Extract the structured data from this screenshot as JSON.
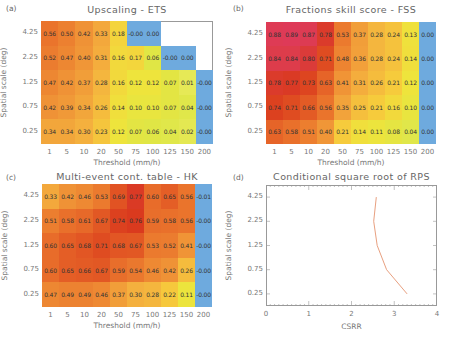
{
  "chart_data": [
    {
      "id": "a",
      "type": "heatmap",
      "panel_label": "(a)",
      "title": "Upscaling - ETS",
      "xlabel": "Threshold (mm/h)",
      "ylabel": "Spatial scale (deg)",
      "x_categories": [
        "1",
        "5",
        "10",
        "20",
        "50",
        "75",
        "100",
        "125",
        "150",
        "200"
      ],
      "y_categories": [
        "4.25",
        "2.25",
        "1.25",
        "0.75",
        "0.25"
      ],
      "values": [
        [
          "0.56",
          "0.50",
          "0.42",
          "0.33",
          "0.18",
          "-0.00",
          "0.00",
          null,
          null,
          null
        ],
        [
          "0.52",
          "0.47",
          "0.40",
          "0.31",
          "0.16",
          "0.17",
          "0.06",
          "-0.00",
          "0.00",
          null
        ],
        [
          "0.47",
          "0.42",
          "0.37",
          "0.28",
          "0.16",
          "0.12",
          "0.12",
          "0.07",
          "0.01",
          "-0.00"
        ],
        [
          "0.42",
          "0.39",
          "0.34",
          "0.26",
          "0.14",
          "0.10",
          "0.10",
          "0.07",
          "0.04",
          "-0.00"
        ],
        [
          "0.34",
          "0.34",
          "0.30",
          "0.23",
          "0.12",
          "0.07",
          "0.06",
          "0.04",
          "0.02",
          "-0.00"
        ]
      ]
    },
    {
      "id": "b",
      "type": "heatmap",
      "panel_label": "(b)",
      "title": "Fractions skill score - FSS",
      "xlabel": "Threshold (mm/h)",
      "ylabel": "Spatial scale (deg)",
      "x_categories": [
        "1",
        "5",
        "10",
        "20",
        "50",
        "75",
        "100",
        "125",
        "150",
        "200"
      ],
      "y_categories": [
        "4.25",
        "2.25",
        "1.25",
        "0.75",
        "0.25"
      ],
      "values": [
        [
          "0.88",
          "0.89",
          "0.87",
          "0.78",
          "0.53",
          "0.37",
          "0.28",
          "0.24",
          "0.13",
          "0.00"
        ],
        [
          "0.84",
          "0.84",
          "0.80",
          "0.71",
          "0.48",
          "0.36",
          "0.28",
          "0.24",
          "0.14",
          "0.00"
        ],
        [
          "0.78",
          "0.77",
          "0.73",
          "0.63",
          "0.41",
          "0.31",
          "0.26",
          "0.21",
          "0.12",
          "0.00"
        ],
        [
          "0.74",
          "0.71",
          "0.66",
          "0.56",
          "0.35",
          "0.25",
          "0.21",
          "0.16",
          "0.10",
          "0.00"
        ],
        [
          "0.63",
          "0.58",
          "0.51",
          "0.40",
          "0.21",
          "0.14",
          "0.11",
          "0.08",
          "0.04",
          "0.00"
        ]
      ]
    },
    {
      "id": "c",
      "type": "heatmap",
      "panel_label": "(c)",
      "title": "Multi-event cont. table - HK",
      "xlabel": "Threshold (mm/h)",
      "ylabel": "Spatial scale (deg)",
      "x_categories": [
        "1",
        "5",
        "10",
        "20",
        "50",
        "75",
        "100",
        "125",
        "150",
        "200"
      ],
      "y_categories": [
        "4.25",
        "2.25",
        "1.25",
        "0.75",
        "0.25"
      ],
      "values": [
        [
          "0.33",
          "0.42",
          "0.46",
          "0.53",
          "0.69",
          "0.77",
          "0.60",
          "0.65",
          "0.56",
          "-0.01"
        ],
        [
          "0.51",
          "0.58",
          "0.61",
          "0.67",
          "0.74",
          "0.76",
          "0.59",
          "0.58",
          "0.56",
          "-0.00"
        ],
        [
          "0.60",
          "0.65",
          "0.68",
          "0.71",
          "0.68",
          "0.67",
          "0.53",
          "0.52",
          "0.41",
          "-0.00"
        ],
        [
          "0.60",
          "0.65",
          "0.66",
          "0.67",
          "0.59",
          "0.54",
          "0.46",
          "0.42",
          "0.26",
          "-0.00"
        ],
        [
          "0.47",
          "0.49",
          "0.49",
          "0.46",
          "0.37",
          "0.30",
          "0.28",
          "0.22",
          "0.11",
          "-0.00"
        ]
      ]
    },
    {
      "id": "d",
      "type": "line",
      "panel_label": "(d)",
      "title": "Conditional square root of RPS",
      "xlabel": "CSRR",
      "ylabel": "Spatial scale (deg)",
      "x_ticks": [
        "0",
        "1",
        "2",
        "3",
        "4"
      ],
      "y_categories": [
        "4.25",
        "2.25",
        "1.25",
        "0.75",
        "0.25"
      ],
      "xlim": [
        0,
        4
      ],
      "series": [
        {
          "name": "CSRR",
          "color": "#e8a080",
          "y": [
            "4.25",
            "2.25",
            "1.25",
            "0.75",
            "0.25"
          ],
          "x": [
            2.58,
            2.52,
            2.6,
            2.82,
            3.3
          ]
        }
      ],
      "grid": false
    }
  ]
}
